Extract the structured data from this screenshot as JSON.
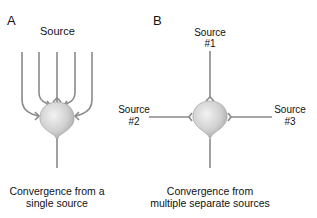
{
  "panel_a": {
    "letter": "A",
    "source_label": "Source",
    "caption_line1": "Convergence from a",
    "caption_line2": "single source"
  },
  "panel_b": {
    "letter": "B",
    "source1_line1": "Source",
    "source1_line2": "#1",
    "source2_line1": "Source",
    "source2_line2": "#2",
    "source3_line1": "Source",
    "source3_line2": "#3",
    "caption_line1": "Convergence from",
    "caption_line2": "multiple separate sources"
  },
  "colors": {
    "axon": "#8a8a8a",
    "soma_light": "#efefef",
    "soma_dark": "#a8a8a8"
  }
}
